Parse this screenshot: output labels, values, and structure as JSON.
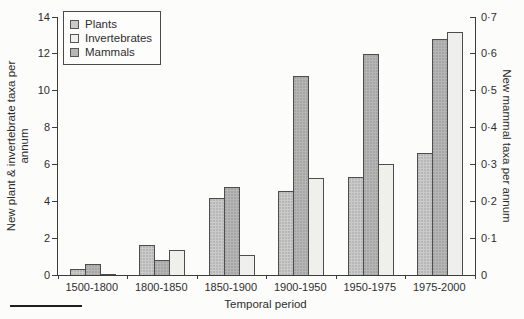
{
  "chart_data": {
    "type": "bar",
    "title": "",
    "xlabel": "Temporal period",
    "ylabel_left_lines": [
      "New plant & invertebrate taxa per",
      "annum"
    ],
    "ylabel_right": "New mammal taxa per annum",
    "categories": [
      "1500-1800",
      "1800-1850",
      "1850-1900",
      "1900-1950",
      "1950-1975",
      "1975-2000"
    ],
    "left_axis": {
      "min": 0,
      "max": 14,
      "ticks": [
        0,
        2,
        4,
        6,
        8,
        10,
        12,
        14
      ]
    },
    "right_axis": {
      "min": 0,
      "max": 0.7,
      "ticks": [
        0,
        0.1,
        0.2,
        0.3,
        0.4,
        0.5,
        0.6,
        0.7
      ],
      "tick_labels": [
        "0",
        "0·1",
        "0·2",
        "0·3",
        "0·4",
        "0·5",
        "0·6",
        "0·7"
      ]
    },
    "grid": false,
    "legend": {
      "position": "top-left-inside",
      "entries": [
        "Plants",
        "Invertebrates",
        "Mammals"
      ]
    },
    "series": [
      {
        "name": "Plants",
        "axis": "left",
        "bar_position": 0,
        "color": "#cacaca",
        "stipple": true,
        "values": [
          0.3,
          1.65,
          4.2,
          4.55,
          5.3,
          6.6
        ]
      },
      {
        "name": "Invertebrates",
        "axis": "left",
        "bar_position": 2,
        "color": "#efefeb",
        "stipple": false,
        "values": [
          0.05,
          1.35,
          1.1,
          5.25,
          6.0,
          13.2
        ]
      },
      {
        "name": "Mammals",
        "axis": "right",
        "bar_position": 1,
        "color": "#b6b6b6",
        "stipple": true,
        "values": [
          0.03,
          0.04,
          0.24,
          0.54,
          0.6,
          0.64
        ]
      }
    ]
  },
  "colors": {
    "axis_line": "#3c3c3c",
    "text": "#2e2e2e",
    "background": "#fcfcfb"
  }
}
